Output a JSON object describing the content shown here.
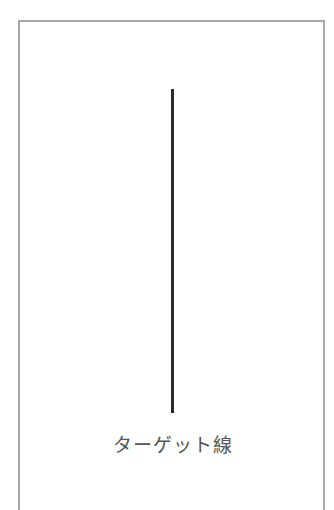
{
  "diagram": {
    "caption": "ターゲット線",
    "line": {
      "orientation": "vertical",
      "color": "#2a2a2a"
    },
    "frame": {
      "border_color": "#a8a8a8"
    }
  }
}
